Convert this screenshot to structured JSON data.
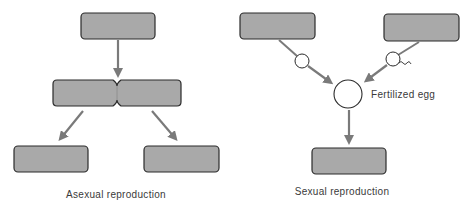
{
  "diagram": {
    "colors": {
      "box_fill": "#a9a9a9",
      "box_stroke": "#2b2b2b",
      "arrow": "#7a7a7a",
      "circle_fill": "#ffffff",
      "circle_stroke": "#2b2b2b",
      "text": "#3a3a3a",
      "background": "#ffffff"
    },
    "asexual": {
      "caption": "Asexual reproduction",
      "parent_box": {
        "x": 81,
        "y": 13,
        "w": 74,
        "h": 26
      },
      "dividing_cell": {
        "x": 53,
        "y": 80,
        "w": 128,
        "h": 26,
        "pinch_x": 117
      },
      "offspring_boxes": [
        {
          "x": 14,
          "y": 146,
          "w": 74,
          "h": 26
        },
        {
          "x": 144,
          "y": 146,
          "w": 75,
          "h": 26
        }
      ]
    },
    "sexual": {
      "caption": "Sexual reproduction",
      "egg_label": "Fertilized egg",
      "parent_boxes": [
        {
          "x": 240,
          "y": 13,
          "w": 75,
          "h": 26
        },
        {
          "x": 384,
          "y": 14,
          "w": 75,
          "h": 27
        }
      ],
      "gametes": [
        {
          "type": "egg",
          "cx": 302,
          "cy": 61,
          "r": 7
        },
        {
          "type": "sperm",
          "cx": 393,
          "cy": 59,
          "r": 7
        }
      ],
      "zygote": {
        "cx": 348,
        "cy": 94,
        "r": 14
      },
      "offspring_box": {
        "x": 312,
        "y": 148,
        "w": 74,
        "h": 26
      }
    }
  }
}
